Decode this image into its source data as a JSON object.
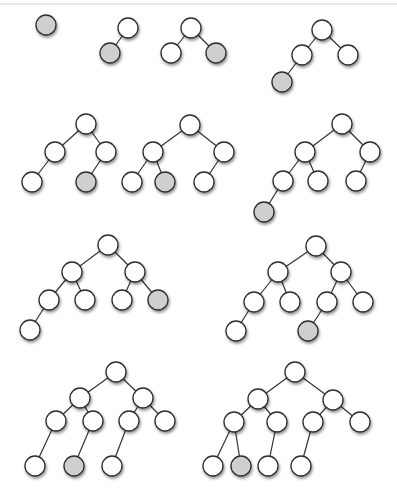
{
  "diagram": {
    "title": "",
    "colors": {
      "background": "#ffffff",
      "node_fill": "#ffffff",
      "highlight_fill": "#cfcfcf",
      "stroke": "#2e2e2e",
      "edge": "#333333",
      "shadow": "#9a9a9a"
    },
    "node_radius": 10,
    "trees": [
      {
        "nodes": [
          [
            46,
            25,
            1
          ]
        ],
        "edges": []
      },
      {
        "nodes": [
          [
            128,
            28,
            0
          ],
          [
            110,
            53,
            1
          ]
        ],
        "edges": [
          [
            0,
            1
          ]
        ]
      },
      {
        "nodes": [
          [
            191,
            28,
            0
          ],
          [
            171,
            53,
            0
          ],
          [
            216,
            53,
            1
          ]
        ],
        "edges": [
          [
            0,
            1
          ],
          [
            0,
            2
          ]
        ]
      },
      {
        "nodes": [
          [
            322,
            30,
            0
          ],
          [
            302,
            55,
            0
          ],
          [
            348,
            55,
            0
          ],
          [
            282,
            82,
            1
          ]
        ],
        "edges": [
          [
            0,
            1
          ],
          [
            0,
            2
          ],
          [
            1,
            3
          ]
        ]
      },
      {
        "nodes": [
          [
            86,
            124,
            0
          ],
          [
            55,
            152,
            0
          ],
          [
            106,
            152,
            0
          ],
          [
            32,
            182,
            0
          ],
          [
            86,
            182,
            1
          ]
        ],
        "edges": [
          [
            0,
            1
          ],
          [
            0,
            2
          ],
          [
            1,
            3
          ],
          [
            2,
            4
          ]
        ]
      },
      {
        "nodes": [
          [
            190,
            125,
            0
          ],
          [
            153,
            152,
            0
          ],
          [
            224,
            152,
            0
          ],
          [
            132,
            182,
            0
          ],
          [
            165,
            182,
            1
          ],
          [
            204,
            182,
            0
          ]
        ],
        "edges": [
          [
            0,
            1
          ],
          [
            0,
            2
          ],
          [
            1,
            3
          ],
          [
            1,
            4
          ],
          [
            2,
            5
          ]
        ]
      },
      {
        "nodes": [
          [
            342,
            124,
            0
          ],
          [
            305,
            152,
            0
          ],
          [
            370,
            152,
            0
          ],
          [
            283,
            181,
            0
          ],
          [
            318,
            181,
            0
          ],
          [
            356,
            181,
            0
          ],
          [
            264,
            212,
            1
          ]
        ],
        "edges": [
          [
            0,
            1
          ],
          [
            0,
            2
          ],
          [
            1,
            3
          ],
          [
            1,
            4
          ],
          [
            2,
            5
          ],
          [
            3,
            6
          ]
        ]
      },
      {
        "nodes": [
          [
            108,
            245,
            0
          ],
          [
            72,
            272,
            0
          ],
          [
            135,
            272,
            0
          ],
          [
            49,
            300,
            0
          ],
          [
            85,
            300,
            0
          ],
          [
            122,
            300,
            0
          ],
          [
            158,
            300,
            1
          ],
          [
            30,
            330,
            0
          ]
        ],
        "edges": [
          [
            0,
            1
          ],
          [
            0,
            2
          ],
          [
            1,
            3
          ],
          [
            1,
            4
          ],
          [
            2,
            5
          ],
          [
            2,
            6
          ],
          [
            3,
            7
          ]
        ]
      },
      {
        "nodes": [
          [
            316,
            246,
            0
          ],
          [
            278,
            272,
            0
          ],
          [
            341,
            272,
            0
          ],
          [
            254,
            302,
            0
          ],
          [
            290,
            302,
            0
          ],
          [
            327,
            302,
            0
          ],
          [
            363,
            302,
            0
          ],
          [
            236,
            331,
            0
          ],
          [
            308,
            331,
            1
          ]
        ],
        "edges": [
          [
            0,
            1
          ],
          [
            0,
            2
          ],
          [
            1,
            3
          ],
          [
            1,
            4
          ],
          [
            2,
            5
          ],
          [
            2,
            6
          ],
          [
            3,
            7
          ],
          [
            5,
            8
          ]
        ]
      },
      {
        "nodes": [
          [
            116,
            372,
            0
          ],
          [
            80,
            398,
            0
          ],
          [
            143,
            398,
            0
          ],
          [
            56,
            421,
            0
          ],
          [
            93,
            421,
            0
          ],
          [
            129,
            421,
            0
          ],
          [
            165,
            421,
            0
          ],
          [
            35,
            466,
            0
          ],
          [
            74,
            466,
            1
          ],
          [
            112,
            466,
            0
          ]
        ],
        "edges": [
          [
            0,
            1
          ],
          [
            0,
            2
          ],
          [
            1,
            3
          ],
          [
            1,
            4
          ],
          [
            2,
            5
          ],
          [
            2,
            6
          ],
          [
            3,
            7
          ],
          [
            4,
            8
          ],
          [
            5,
            9
          ]
        ]
      },
      {
        "nodes": [
          [
            295,
            372,
            0
          ],
          [
            258,
            399,
            0
          ],
          [
            333,
            400,
            0
          ],
          [
            234,
            422,
            0
          ],
          [
            277,
            422,
            0
          ],
          [
            313,
            422,
            0
          ],
          [
            360,
            422,
            0
          ],
          [
            213,
            466,
            0
          ],
          [
            241,
            466,
            1
          ],
          [
            268,
            466,
            0
          ],
          [
            301,
            466,
            0
          ]
        ],
        "edges": [
          [
            0,
            1
          ],
          [
            0,
            2
          ],
          [
            1,
            3
          ],
          [
            1,
            4
          ],
          [
            2,
            5
          ],
          [
            2,
            6
          ],
          [
            3,
            7
          ],
          [
            3,
            8
          ],
          [
            4,
            9
          ],
          [
            5,
            10
          ]
        ]
      }
    ]
  }
}
